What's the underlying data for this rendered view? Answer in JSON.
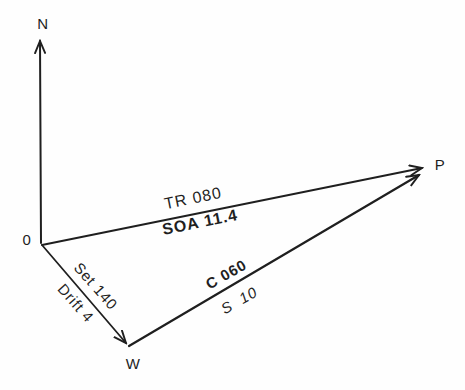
{
  "diagram": {
    "type": "navigation-current-triangle",
    "ink_color": "#1f1f1f",
    "background_color": "#fefefe",
    "points": {
      "north": "N",
      "origin": "0",
      "destination": "P",
      "water": "W"
    },
    "vectors": {
      "track": {
        "from": "0",
        "to": "P",
        "track_label": "TR 080",
        "speed_of_advance_label": "SOA 11.4"
      },
      "current": {
        "from": "0",
        "to": "W",
        "set_label": "Set 140",
        "drift_label": "Drift 4"
      },
      "course": {
        "from": "W",
        "to": "P",
        "course_label": "C 060",
        "speed_label": "S  10"
      }
    }
  }
}
